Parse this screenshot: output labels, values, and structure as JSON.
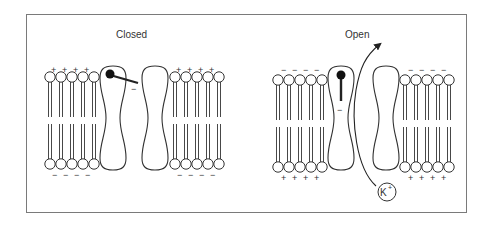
{
  "diagram": {
    "panels": [
      {
        "label": "Closed",
        "top_charges": [
          "+",
          "+",
          "+",
          "+"
        ],
        "bottom_charges": [
          "−",
          "−",
          "−",
          "−"
        ],
        "gate_charge": "−"
      },
      {
        "label": "Open",
        "top_charges": [
          "−",
          "−",
          "−",
          "−"
        ],
        "bottom_charges": [
          "+",
          "+",
          "+",
          "+"
        ],
        "gate_charge": "−",
        "ion_label": "K",
        "ion_superscript": "+"
      }
    ],
    "colors": {
      "stroke": "#333333",
      "frame": "#7a7a7a",
      "fill": "#ffffff"
    }
  }
}
